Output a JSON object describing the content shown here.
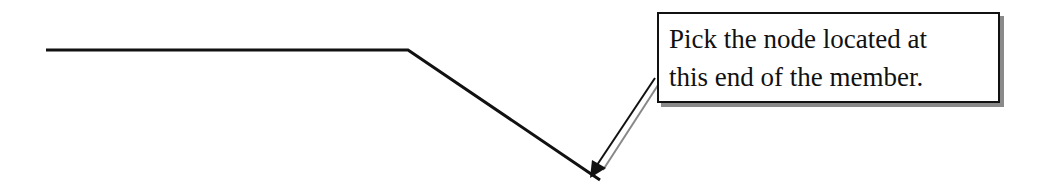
{
  "diagram": {
    "member": {
      "horizontal_start": [
        46,
        50
      ],
      "bend_point": [
        408,
        50
      ],
      "end_point": [
        600,
        180
      ],
      "color": "#111111"
    },
    "callout": {
      "lines": [
        "Pick the node located at",
        "this end of the member."
      ],
      "border_color": "#111111",
      "shadow_color": "#8a8a8a"
    },
    "arrow": {
      "from": [
        655,
        78
      ],
      "to": [
        590,
        178
      ]
    }
  }
}
